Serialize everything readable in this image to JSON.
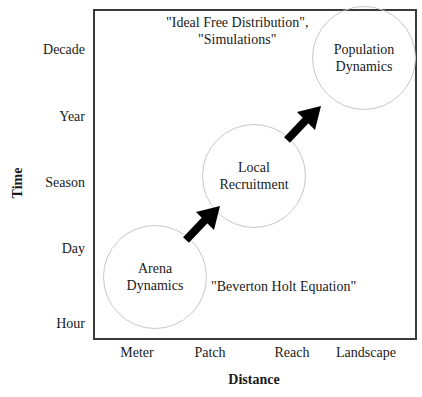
{
  "diagram": {
    "y_axis": {
      "title": "Time",
      "ticks": [
        "Decade",
        "Year",
        "Season",
        "Day",
        "Hour"
      ]
    },
    "x_axis": {
      "title": "Distance",
      "ticks": [
        "Meter",
        "Patch",
        "Reach",
        "Landscape"
      ]
    },
    "nodes": [
      {
        "id": "arena",
        "lines": [
          "Arena",
          "Dynamics"
        ]
      },
      {
        "id": "local",
        "lines": [
          "Local",
          "Recruitment"
        ]
      },
      {
        "id": "population",
        "lines": [
          "Population",
          "Dynamics"
        ]
      }
    ],
    "edges": [
      {
        "from": "arena",
        "to": "local",
        "style": "thick-black-arrow"
      },
      {
        "from": "local",
        "to": "population",
        "style": "thick-black-arrow"
      }
    ],
    "annotations": {
      "top": [
        "\"Ideal Free Distribution\",",
        "\"Simulations\""
      ],
      "bottom": "\"Beverton Holt Equation\""
    },
    "colors": {
      "frame": "#3a3a3a",
      "circle_stroke": "#c8c8c8",
      "arrow": "#000000",
      "text": "#1a1a1a"
    }
  }
}
